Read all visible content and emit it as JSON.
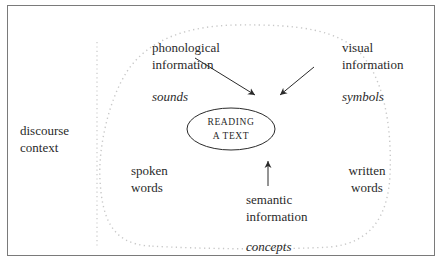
{
  "diagram": {
    "center": {
      "line1": "READING",
      "line2": "A TEXT"
    },
    "outer_label": {
      "line1": "discourse",
      "line2": "context"
    },
    "inputs": {
      "phonological": {
        "line1": "phonological",
        "line2": "information",
        "italic": "sounds"
      },
      "visual": {
        "line1": "visual",
        "line2": "information",
        "italic": "symbols"
      },
      "semantic": {
        "line1": "semantic",
        "line2": "information",
        "italic": "concepts"
      }
    },
    "sides": {
      "left": {
        "line1": "spoken",
        "line2": "words"
      },
      "right": {
        "line1": "written",
        "line2": "words"
      }
    }
  }
}
